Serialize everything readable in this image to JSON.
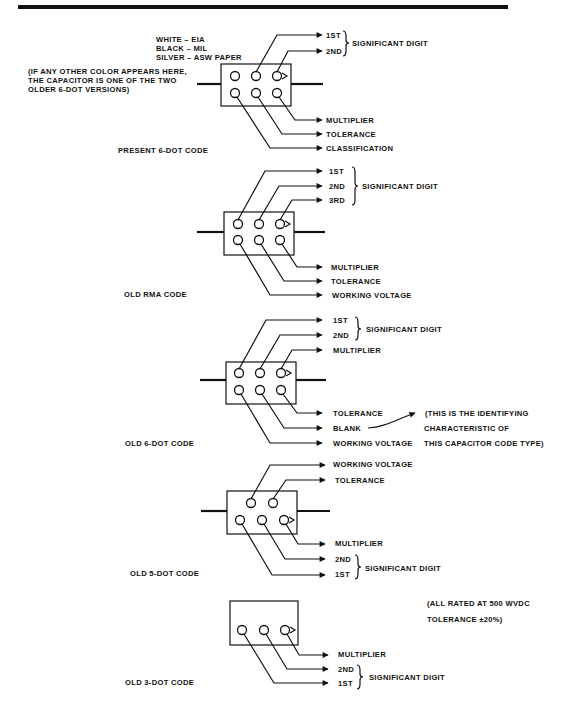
{
  "figure": {
    "sections": [
      {
        "title": "PRESENT 6-DOT CODE",
        "color_key": [
          "WHITE – EIA",
          "BLACK – MIL",
          "SILVER – ASW PAPER"
        ],
        "note": [
          "(IF ANY OTHER COLOR APPEARS HERE,",
          "THE CAPACITOR IS ONE OF THE TWO",
          "OLDER 6-DOT VERSIONS)"
        ],
        "labels": [
          "1ST",
          "2ND",
          "MULTIPLIER",
          "TOLERANCE",
          "CLASSIFICATION"
        ],
        "group_label": "SIGNIFICANT DIGIT"
      },
      {
        "title": "OLD RMA CODE",
        "labels": [
          "1ST",
          "2ND",
          "3RD",
          "MULTIPLIER",
          "TOLERANCE",
          "WORKING VOLTAGE"
        ],
        "group_label": "SIGNIFICANT DIGIT"
      },
      {
        "title": "OLD 6-DOT CODE",
        "labels": [
          "1ST",
          "2ND",
          "MULTIPLIER",
          "TOLERANCE",
          "BLANK",
          "WORKING VOLTAGE"
        ],
        "group_label": "SIGNIFICANT DIGIT",
        "note": [
          "(THIS IS THE IDENTIFYING",
          "CHARACTERISTIC OF",
          "THIS CAPACITOR CODE TYPE)"
        ]
      },
      {
        "title": "OLD 5-DOT CODE",
        "labels": [
          "WORKING VOLTAGE",
          "TOLERANCE",
          "MULTIPLIER",
          "2ND",
          "1ST"
        ],
        "group_label": "SIGNIFICANT DIGIT"
      },
      {
        "title": "OLD 3-DOT CODE",
        "labels": [
          "MULTIPLIER",
          "2ND",
          "1ST"
        ],
        "group_label": "SIGNIFICANT DIGIT",
        "note": [
          "(ALL RATED AT 500 WVDC",
          "TOLERANCE ±20%)"
        ]
      }
    ]
  }
}
